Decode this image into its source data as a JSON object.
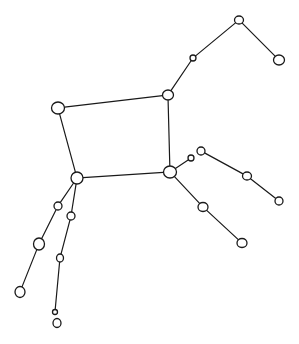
{
  "diagram": {
    "type": "constellation-sketch",
    "background": "#ffffff",
    "stroke": "#1a1a1a",
    "stars": [
      {
        "id": "A",
        "x": 239,
        "y": 20,
        "rx": 4.5,
        "ry": 4
      },
      {
        "id": "B",
        "x": 279,
        "y": 60,
        "rx": 5.5,
        "ry": 5
      },
      {
        "id": "C",
        "x": 193,
        "y": 58,
        "rx": 3,
        "ry": 3
      },
      {
        "id": "D",
        "x": 168,
        "y": 95,
        "rx": 5.5,
        "ry": 5
      },
      {
        "id": "E",
        "x": 58,
        "y": 108,
        "rx": 6.5,
        "ry": 6
      },
      {
        "id": "F",
        "x": 77,
        "y": 178,
        "rx": 6,
        "ry": 6
      },
      {
        "id": "G",
        "x": 170,
        "y": 172,
        "rx": 6.5,
        "ry": 6
      },
      {
        "id": "H",
        "x": 191,
        "y": 158,
        "rx": 3,
        "ry": 3
      },
      {
        "id": "I",
        "x": 201,
        "y": 151,
        "rx": 4,
        "ry": 4
      },
      {
        "id": "J",
        "x": 247,
        "y": 176,
        "rx": 4.5,
        "ry": 4
      },
      {
        "id": "K",
        "x": 279,
        "y": 201,
        "rx": 4,
        "ry": 4
      },
      {
        "id": "L",
        "x": 203,
        "y": 207,
        "rx": 5,
        "ry": 4.5
      },
      {
        "id": "M",
        "x": 242,
        "y": 243,
        "rx": 5,
        "ry": 4.5
      },
      {
        "id": "N",
        "x": 58,
        "y": 206,
        "rx": 4,
        "ry": 4
      },
      {
        "id": "O",
        "x": 39,
        "y": 244,
        "rx": 5.5,
        "ry": 6
      },
      {
        "id": "P",
        "x": 20,
        "y": 292,
        "rx": 5,
        "ry": 5.5
      },
      {
        "id": "Q",
        "x": 71,
        "y": 216,
        "rx": 4,
        "ry": 4
      },
      {
        "id": "R",
        "x": 60,
        "y": 258,
        "rx": 3.5,
        "ry": 4
      },
      {
        "id": "S",
        "x": 55,
        "y": 312,
        "rx": 2.5,
        "ry": 2.5
      },
      {
        "id": "T",
        "x": 57,
        "y": 323,
        "rx": 4,
        "ry": 4.5
      }
    ],
    "edges": [
      [
        "A",
        "B"
      ],
      [
        "A",
        "C"
      ],
      [
        "C",
        "D"
      ],
      [
        "E",
        "D"
      ],
      [
        "E",
        "F"
      ],
      [
        "D",
        "G"
      ],
      [
        "F",
        "G"
      ],
      [
        "G",
        "H"
      ],
      [
        "I",
        "J"
      ],
      [
        "J",
        "K"
      ],
      [
        "G",
        "L"
      ],
      [
        "L",
        "M"
      ],
      [
        "F",
        "N"
      ],
      [
        "N",
        "O"
      ],
      [
        "O",
        "P"
      ],
      [
        "F",
        "Q"
      ],
      [
        "Q",
        "R"
      ],
      [
        "R",
        "S"
      ]
    ]
  }
}
